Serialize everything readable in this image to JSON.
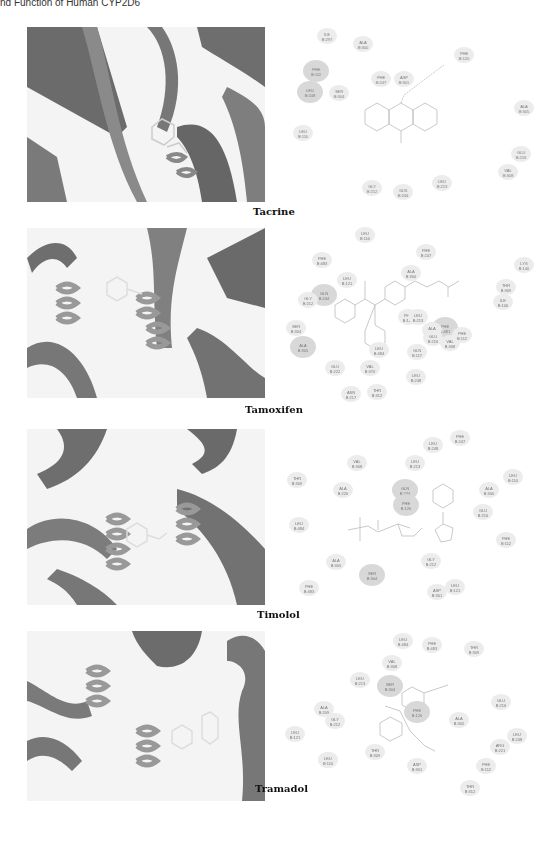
{
  "page": {
    "running_header": "nd Function of Human CYP2D6"
  },
  "figures": [
    {
      "caption": "Tacrine",
      "residues": [
        {
          "name": "ILE",
          "id": "B:297"
        },
        {
          "name": "ALA",
          "id": "B:300"
        },
        {
          "name": "PHE",
          "id": "B:120"
        },
        {
          "name": "PHE",
          "id": "B:112"
        },
        {
          "name": "PHE",
          "id": "B:247"
        },
        {
          "name": "ASP",
          "id": "B:301"
        },
        {
          "name": "LEU",
          "id": "B:248"
        },
        {
          "name": "SER",
          "id": "B:304"
        },
        {
          "name": "ALA",
          "id": "B:305"
        },
        {
          "name": "LEU",
          "id": "B:110"
        },
        {
          "name": "GLU",
          "id": "B:216"
        },
        {
          "name": "VAL",
          "id": "B:308"
        },
        {
          "name": "GLY",
          "id": "B:212"
        },
        {
          "name": "GLN",
          "id": "B:244"
        },
        {
          "name": "LEU",
          "id": "B:213"
        }
      ]
    },
    {
      "caption": "Tamoxifen",
      "residues": [
        {
          "name": "LEU",
          "id": "B:110"
        },
        {
          "name": "PHE",
          "id": "B:483"
        },
        {
          "name": "PHE",
          "id": "B:247"
        },
        {
          "name": "ALA",
          "id": "B:300"
        },
        {
          "name": "LYS",
          "id": "B:140"
        },
        {
          "name": "LEU",
          "id": "B:121"
        },
        {
          "name": "THR",
          "id": "B:309"
        },
        {
          "name": "GLN",
          "id": "B:244"
        },
        {
          "name": "GLY",
          "id": "B:212"
        },
        {
          "name": "SER",
          "id": "B:304"
        },
        {
          "name": "ILE",
          "id": "B:106"
        },
        {
          "name": "LEU",
          "id": "B:484"
        },
        {
          "name": "ALA",
          "id": "B:305"
        },
        {
          "name": "PHE",
          "id": "B:120"
        },
        {
          "name": "PHE",
          "id": "B:481"
        },
        {
          "name": "ALA",
          "id": "B:209"
        },
        {
          "name": "VAL",
          "id": "B:308"
        },
        {
          "name": "VAL",
          "id": "B:370"
        },
        {
          "name": "GLU",
          "id": "B:216"
        },
        {
          "name": "LEU",
          "id": "B:213"
        },
        {
          "name": "PHE",
          "id": "B:112"
        },
        {
          "name": "GLN",
          "id": "B:117"
        },
        {
          "name": "LEU",
          "id": "B:248"
        },
        {
          "name": "ASN",
          "id": "B:217"
        },
        {
          "name": "THR",
          "id": "B:312"
        },
        {
          "name": "GLU",
          "id": "B:222"
        }
      ]
    },
    {
      "caption": "Timolol",
      "residues": [
        {
          "name": "LEU",
          "id": "B:248"
        },
        {
          "name": "PHE",
          "id": "B:247"
        },
        {
          "name": "VAL",
          "id": "B:308"
        },
        {
          "name": "LEU",
          "id": "B:213"
        },
        {
          "name": "THR",
          "id": "B:309"
        },
        {
          "name": "LEU",
          "id": "B:110"
        },
        {
          "name": "ALA",
          "id": "B:220"
        },
        {
          "name": "GLN",
          "id": "B:244"
        },
        {
          "name": "ALA",
          "id": "B:300"
        },
        {
          "name": "PHE",
          "id": "B:120"
        },
        {
          "name": "GLU",
          "id": "B:216"
        },
        {
          "name": "LEU",
          "id": "B:484"
        },
        {
          "name": "PHE",
          "id": "B:112"
        },
        {
          "name": "ALA",
          "id": "B:305"
        },
        {
          "name": "GLY",
          "id": "B:212"
        },
        {
          "name": "SER",
          "id": "B:304"
        },
        {
          "name": "PHE",
          "id": "B:483"
        },
        {
          "name": "ASP",
          "id": "B:301"
        },
        {
          "name": "LEU",
          "id": "B:121"
        }
      ]
    },
    {
      "caption": "Tramadol",
      "residues": [
        {
          "name": "LEU",
          "id": "B:484"
        },
        {
          "name": "PHE",
          "id": "B:483"
        },
        {
          "name": "THR",
          "id": "B:309"
        },
        {
          "name": "VAL",
          "id": "B:308"
        },
        {
          "name": "LEU",
          "id": "B:213"
        },
        {
          "name": "SER",
          "id": "B:304"
        },
        {
          "name": "PHE",
          "id": "B:120"
        },
        {
          "name": "ALA",
          "id": "B:209"
        },
        {
          "name": "GLY",
          "id": "B:212"
        },
        {
          "name": "GLU",
          "id": "B:216"
        },
        {
          "name": "ALA",
          "id": "B:305"
        },
        {
          "name": "LEU",
          "id": "B:248"
        },
        {
          "name": "ARG",
          "id": "B:221"
        },
        {
          "name": "LEU",
          "id": "B:121"
        },
        {
          "name": "PHE",
          "id": "B:247"
        },
        {
          "name": "THR",
          "id": "B:309"
        },
        {
          "name": "ASP",
          "id": "B:301"
        },
        {
          "name": "PHE",
          "id": "B:112"
        },
        {
          "name": "LEU",
          "id": "B:110"
        },
        {
          "name": "THR",
          "id": "B:312"
        }
      ]
    }
  ]
}
